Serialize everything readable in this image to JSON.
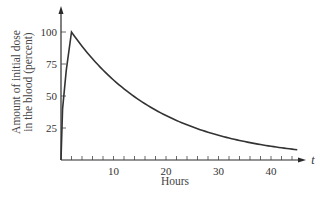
{
  "chart_data": {
    "type": "line",
    "title": "",
    "xlabel": "Hours",
    "xvar": "t",
    "ylabel_lines": [
      "Amount of initial dose",
      "in the blood (percent)"
    ],
    "ylabel": "Amount of initial dose in the blood (percent)",
    "xlim": [
      0,
      47
    ],
    "ylim": [
      0,
      110
    ],
    "xticks_labeled": [
      10,
      20,
      30,
      40
    ],
    "xtick_labels": [
      "10",
      "20",
      "30",
      "40"
    ],
    "xminor_tick_step": 2,
    "yticks": [
      25,
      50,
      75,
      100
    ],
    "ytick_labels": [
      "25",
      "50",
      "75",
      "100"
    ],
    "grid": false,
    "legend": null,
    "series": [
      {
        "name": "Drug concentration",
        "color": "#333333",
        "x": [
          0,
          0.3,
          1,
          2,
          4,
          6,
          8,
          10,
          12,
          15,
          20,
          25,
          30,
          35,
          40,
          45
        ],
        "values": [
          0,
          40,
          70,
          100,
          87,
          77,
          67,
          58,
          52,
          44,
          34,
          26,
          20,
          15,
          11,
          8
        ]
      }
    ]
  }
}
